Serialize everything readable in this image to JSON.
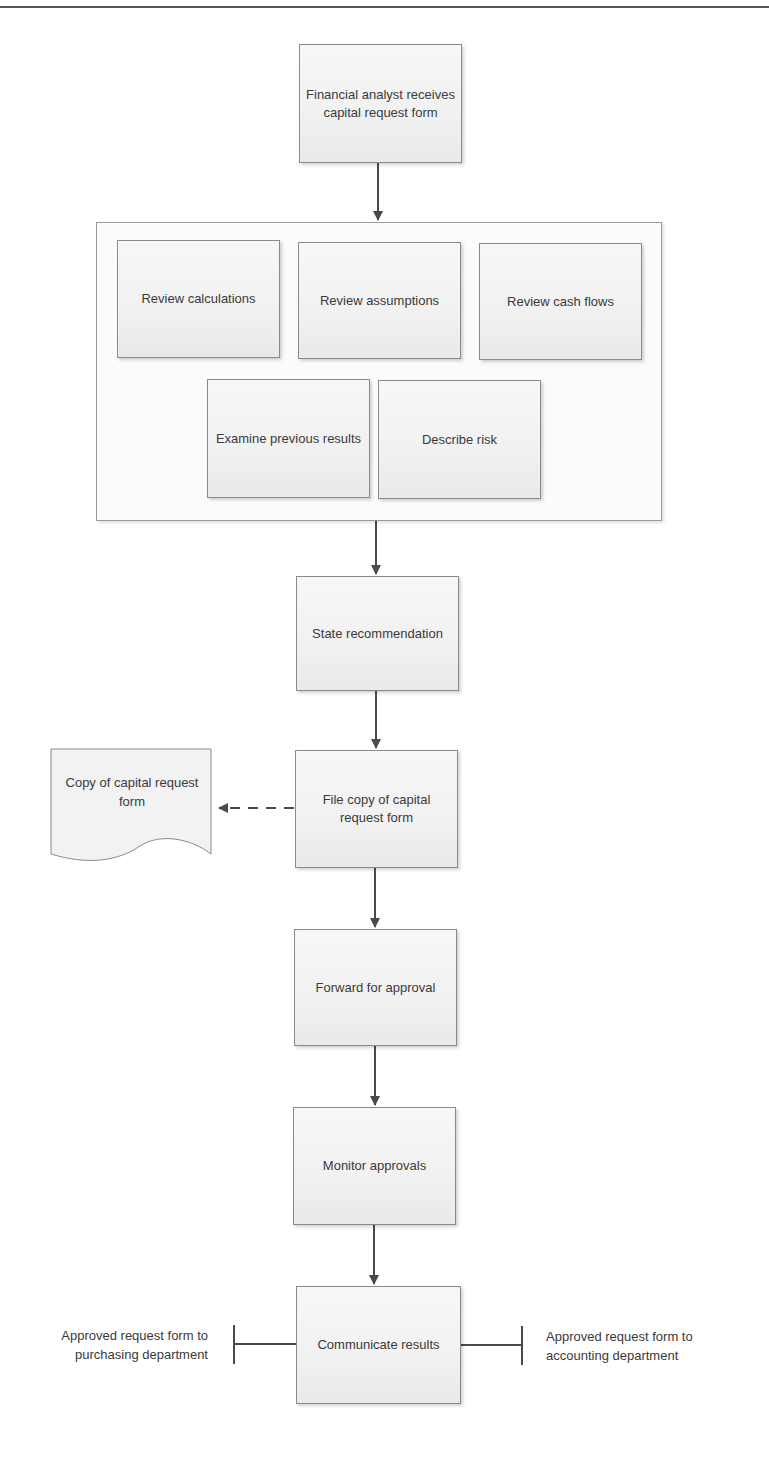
{
  "diagram": {
    "type": "flowchart",
    "steps": {
      "start": "Financial analyst receives capital request form",
      "review_group": {
        "review_calculations": "Review calculations",
        "review_assumptions": "Review assumptions",
        "review_cash_flows": "Review cash flows",
        "examine_previous_results": "Examine previous results",
        "describe_risk": "Describe risk"
      },
      "state_recommendation": "State recommendation",
      "file_copy": "File copy of capital request form",
      "forward_for_approval": "Forward for approval",
      "monitor_approvals": "Monitor approvals",
      "communicate_results": "Communicate results"
    },
    "document": {
      "copy_form": "Copy of capital request form"
    },
    "annotations": {
      "left": "Approved request form to purchasing department",
      "right": "Approved request form to accounting department"
    },
    "colors": {
      "box_fill": "#f3f3f3",
      "box_border": "#8a8a8a",
      "connector": "#4a4a4a",
      "text": "#3a3a3a"
    }
  }
}
